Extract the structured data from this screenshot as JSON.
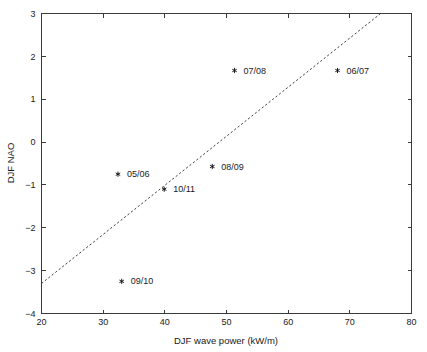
{
  "chart_data": {
    "type": "scatter",
    "title": "",
    "xlabel": "DJF wave power (kW/m)",
    "ylabel": "DJF NAO",
    "xlim": [
      20,
      80
    ],
    "ylim": [
      -4,
      3
    ],
    "xticks": [
      20,
      30,
      40,
      50,
      60,
      70,
      80
    ],
    "yticks": [
      3,
      2,
      1,
      0,
      -1,
      -2,
      -3,
      -4
    ],
    "xtick_labels": [
      "20",
      "30",
      "40",
      "50",
      "60",
      "70",
      "80"
    ],
    "ytick_labels": [
      "3",
      "2",
      "1",
      "0",
      "-1",
      "-2",
      "-3",
      "-4"
    ],
    "grid": false,
    "legend": "none",
    "marker_style": "asterisk",
    "points": [
      {
        "label": "05/06",
        "x": 32.4,
        "y": -0.75,
        "label_dx": 9,
        "label_dy": 3
      },
      {
        "label": "06/07",
        "x": 68.0,
        "y": 1.67,
        "label_dx": 9,
        "label_dy": 3
      },
      {
        "label": "07/08",
        "x": 51.3,
        "y": 1.67,
        "label_dx": 9,
        "label_dy": 3
      },
      {
        "label": "08/09",
        "x": 47.7,
        "y": -0.57,
        "label_dx": 9,
        "label_dy": 3
      },
      {
        "label": "09/10",
        "x": 33.0,
        "y": -3.25,
        "label_dx": 9,
        "label_dy": 3
      },
      {
        "label": "10/11",
        "x": 39.9,
        "y": -1.1,
        "label_dx": 9,
        "label_dy": 3
      }
    ],
    "trend_line": {
      "style": "dashed",
      "x_start": 20.0,
      "y_start": -3.3,
      "x_end": 75.0,
      "y_end": 3.0
    },
    "annotations": []
  }
}
